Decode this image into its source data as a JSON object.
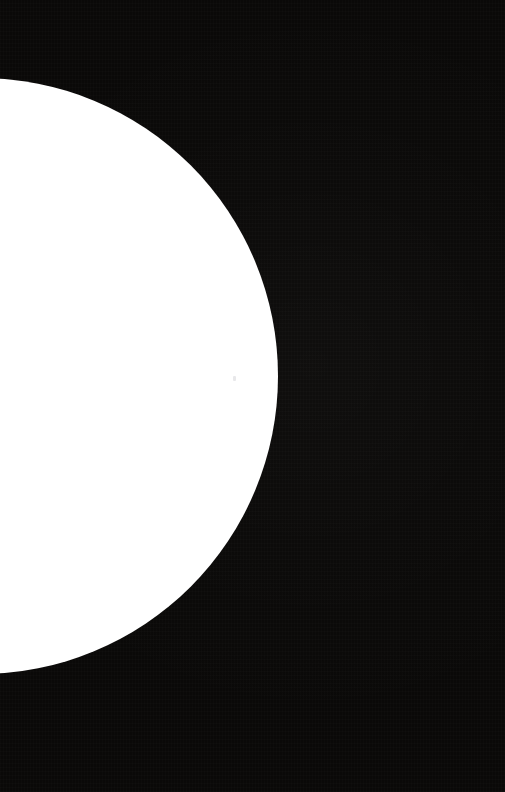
{
  "image": {
    "title": "White circle partially cropped at left edge on black field",
    "width": 505,
    "height": 792,
    "orientation": "portrait",
    "description": "A large solid white disc whose left portion is cropped off the left edge of the frame, set against a flat near-black background. No text, icons or other graphic elements are present."
  },
  "background": {
    "name": "black-field",
    "color": "#0a0908",
    "texture": "fine vertical grain / compression noise",
    "coverage_percent": 72
  },
  "shape": {
    "name": "white-disc",
    "type": "circle",
    "fill_color": "#ffffff",
    "stroke": "none",
    "center_x": -20,
    "center_y": 376,
    "radius": 298,
    "rightmost_x": 278,
    "topmost_y": 78,
    "bottommost_y": 673,
    "left_chord_top_y": 78,
    "left_chord_bottom_y": 673,
    "cropped_edge": "left",
    "coverage_percent": 28
  },
  "artifact": {
    "name": "compression-speck",
    "x": 233,
    "y": 376,
    "color": "#b4b4ba"
  },
  "palette": {
    "foreground": "#ffffff",
    "background": "#0a0908",
    "edge_antialias": "#5a5a5a"
  }
}
